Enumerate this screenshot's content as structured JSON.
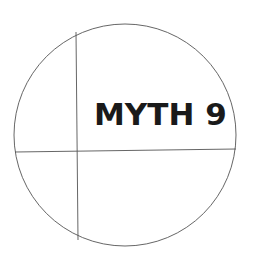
{
  "diagram": {
    "title": "MYTH 9",
    "shape": "circle divided by one vertical and one horizontal line",
    "colors": {
      "stroke": "#555555",
      "text": "#1a1a1a",
      "background": "#ffffff"
    }
  }
}
